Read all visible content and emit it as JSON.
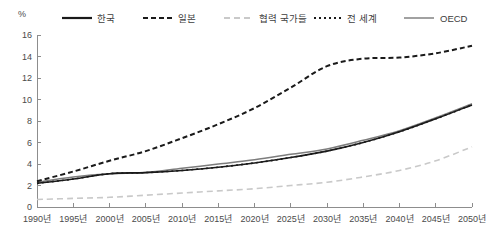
{
  "chart_data": {
    "type": "line",
    "title": "",
    "xlabel": "",
    "ylabel": "",
    "unit_label": "%",
    "xlim": [
      1990,
      2050
    ],
    "ylim": [
      0,
      16
    ],
    "grid": false,
    "legend_position": "top",
    "x": [
      1990,
      1995,
      2000,
      2005,
      2010,
      2015,
      2020,
      2025,
      2030,
      2035,
      2040,
      2045,
      2050
    ],
    "xtick_labels": [
      "1990년",
      "1995년",
      "2000년",
      "2005년",
      "2010년",
      "2015년",
      "2020년",
      "2025년",
      "2030년",
      "2035년",
      "2040년",
      "2045년",
      "2050년"
    ],
    "ytick_labels": [
      "0",
      "2",
      "4",
      "6",
      "8",
      "10",
      "12",
      "14",
      "16"
    ],
    "ytick_values": [
      0,
      2,
      4,
      6,
      8,
      10,
      12,
      14,
      16
    ],
    "series": [
      {
        "name": "한국",
        "style": "solid",
        "color": "#1a1a1a",
        "width": 1.6,
        "values": [
          2.2,
          2.6,
          3.1,
          3.2,
          3.4,
          3.7,
          4.1,
          4.6,
          5.2,
          6.0,
          7.0,
          8.2,
          9.5
        ]
      },
      {
        "name": "일본",
        "style": "dashed",
        "color": "#1a1a1a",
        "width": 2.0,
        "values": [
          2.4,
          3.3,
          4.3,
          5.2,
          6.4,
          7.7,
          9.2,
          11.1,
          13.1,
          13.8,
          13.9,
          14.3,
          15.0
        ]
      },
      {
        "name": "협력 국가들",
        "style": "dashed-light",
        "color": "#c9c9c9",
        "width": 1.6,
        "values": [
          0.7,
          0.8,
          0.9,
          1.1,
          1.3,
          1.5,
          1.7,
          2.0,
          2.3,
          2.8,
          3.4,
          4.3,
          5.6
        ]
      },
      {
        "name": "전 세계",
        "style": "dotted",
        "color": "#1a1a1a",
        "width": 1.6,
        "values": [
          2.2,
          2.6,
          3.1,
          3.2,
          3.4,
          3.7,
          4.1,
          4.6,
          5.2,
          6.0,
          7.0,
          8.2,
          9.5
        ]
      },
      {
        "name": "OECD",
        "style": "solid",
        "color": "#7d7d7d",
        "width": 1.5,
        "values": [
          2.3,
          2.8,
          3.1,
          3.2,
          3.6,
          4.0,
          4.4,
          4.9,
          5.4,
          6.2,
          7.1,
          8.3,
          9.6
        ]
      }
    ]
  },
  "legend": {
    "items": [
      {
        "label": "한국",
        "swatch": "solid-black"
      },
      {
        "label": "일본",
        "swatch": "dashed-black"
      },
      {
        "label": "협력 국가들",
        "swatch": "dashed-light"
      },
      {
        "label": "전 세계",
        "swatch": "dotted-black"
      },
      {
        "label": "OECD",
        "swatch": "solid-gray"
      }
    ]
  }
}
